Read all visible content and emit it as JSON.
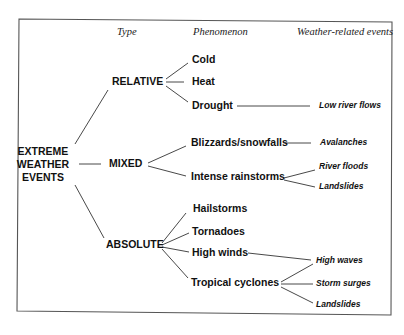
{
  "headers": {
    "type": "Type",
    "phenomenon": "Phenomenon",
    "events": "Weather-related events"
  },
  "root": {
    "line1": "EXTREME",
    "line2": "WEATHER",
    "line3": "EVENTS"
  },
  "types": [
    {
      "label": "RELATIVE",
      "phenomena": [
        {
          "label": "Cold",
          "events": []
        },
        {
          "label": "Heat",
          "events": []
        },
        {
          "label": "Drought",
          "events": [
            "Low river flows"
          ]
        }
      ]
    },
    {
      "label": "MIXED",
      "phenomena": [
        {
          "label": "Blizzards/snowfalls",
          "events": [
            "Avalanches"
          ]
        },
        {
          "label": "Intense rainstorms",
          "events": [
            "River floods",
            "Landslides"
          ]
        }
      ]
    },
    {
      "label": "ABSOLUTE",
      "phenomena": [
        {
          "label": "Hailstorms",
          "events": []
        },
        {
          "label": "Tornadoes",
          "events": []
        },
        {
          "label": "High winds",
          "events": [
            "High waves"
          ]
        },
        {
          "label": "Tropical cyclones",
          "events": [
            "High waves",
            "Storm surges",
            "Landslides"
          ]
        }
      ]
    }
  ],
  "colors": {
    "line": "#333333",
    "text": "#111111",
    "border": "#555555"
  }
}
